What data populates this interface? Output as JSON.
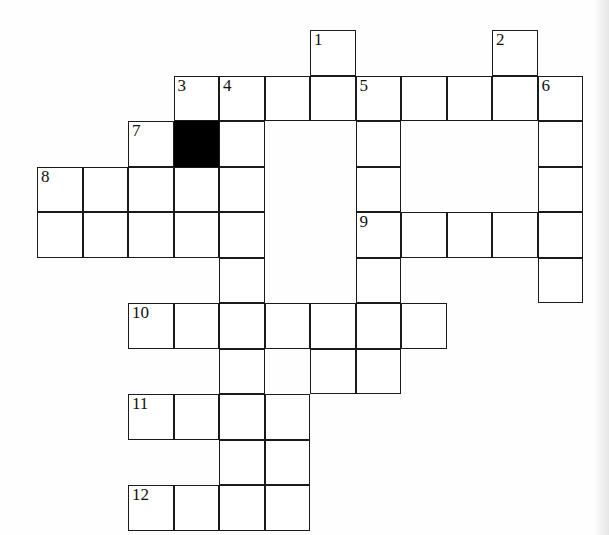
{
  "puzzle": {
    "kind": "crossword-grid",
    "title": "Crossword puzzle grid",
    "geometry": {
      "cell_size": 45.5,
      "origin_x": 37,
      "origin_y": 30,
      "cols": 12,
      "rows": 11,
      "line_color": "#1a1a1a",
      "cell_fill": "#ffffff",
      "block_fill": "#000000",
      "page_background": "#fefefe"
    },
    "numbers_visible": [
      "1",
      "2",
      "3",
      "4",
      "5",
      "6",
      "7",
      "8",
      "9",
      "10",
      "11",
      "12"
    ],
    "cells": [
      {
        "r": 0,
        "c": 6,
        "n": "1"
      },
      {
        "r": 0,
        "c": 10,
        "n": "2"
      },
      {
        "r": 1,
        "c": 3,
        "n": "3"
      },
      {
        "r": 1,
        "c": 4,
        "n": "4"
      },
      {
        "r": 1,
        "c": 5,
        "n": ""
      },
      {
        "r": 1,
        "c": 6,
        "n": ""
      },
      {
        "r": 1,
        "c": 7,
        "n": "5"
      },
      {
        "r": 1,
        "c": 8,
        "n": ""
      },
      {
        "r": 1,
        "c": 9,
        "n": ""
      },
      {
        "r": 1,
        "c": 10,
        "n": ""
      },
      {
        "r": 1,
        "c": 11,
        "n": "6"
      },
      {
        "r": 2,
        "c": 2,
        "n": "7"
      },
      {
        "r": 2,
        "c": 3,
        "n": "",
        "block": true
      },
      {
        "r": 2,
        "c": 4,
        "n": ""
      },
      {
        "r": 2,
        "c": 7,
        "n": ""
      },
      {
        "r": 2,
        "c": 11,
        "n": ""
      },
      {
        "r": 3,
        "c": 0,
        "n": "8"
      },
      {
        "r": 3,
        "c": 1,
        "n": ""
      },
      {
        "r": 3,
        "c": 2,
        "n": ""
      },
      {
        "r": 3,
        "c": 3,
        "n": ""
      },
      {
        "r": 3,
        "c": 4,
        "n": ""
      },
      {
        "r": 3,
        "c": 7,
        "n": ""
      },
      {
        "r": 3,
        "c": 11,
        "n": ""
      },
      {
        "r": 4,
        "c": 0,
        "n": ""
      },
      {
        "r": 4,
        "c": 1,
        "n": ""
      },
      {
        "r": 4,
        "c": 2,
        "n": ""
      },
      {
        "r": 4,
        "c": 3,
        "n": ""
      },
      {
        "r": 4,
        "c": 4,
        "n": ""
      },
      {
        "r": 4,
        "c": 7,
        "n": "9"
      },
      {
        "r": 4,
        "c": 8,
        "n": ""
      },
      {
        "r": 4,
        "c": 9,
        "n": ""
      },
      {
        "r": 4,
        "c": 10,
        "n": ""
      },
      {
        "r": 4,
        "c": 11,
        "n": ""
      },
      {
        "r": 5,
        "c": 4,
        "n": ""
      },
      {
        "r": 5,
        "c": 7,
        "n": ""
      },
      {
        "r": 5,
        "c": 11,
        "n": ""
      },
      {
        "r": 6,
        "c": 2,
        "n": "10"
      },
      {
        "r": 6,
        "c": 3,
        "n": ""
      },
      {
        "r": 6,
        "c": 4,
        "n": ""
      },
      {
        "r": 6,
        "c": 5,
        "n": ""
      },
      {
        "r": 6,
        "c": 6,
        "n": ""
      },
      {
        "r": 6,
        "c": 7,
        "n": ""
      },
      {
        "r": 6,
        "c": 8,
        "n": ""
      },
      {
        "r": 7,
        "c": 4,
        "n": ""
      },
      {
        "r": 7,
        "c": 6,
        "n": ""
      },
      {
        "r": 7,
        "c": 7,
        "n": ""
      },
      {
        "r": 8,
        "c": 2,
        "n": "11"
      },
      {
        "r": 8,
        "c": 3,
        "n": ""
      },
      {
        "r": 8,
        "c": 4,
        "n": ""
      },
      {
        "r": 8,
        "c": 5,
        "n": ""
      },
      {
        "r": 9,
        "c": 4,
        "n": ""
      },
      {
        "r": 9,
        "c": 5,
        "n": ""
      },
      {
        "r": 10,
        "c": 2,
        "n": "12"
      },
      {
        "r": 10,
        "c": 3,
        "n": ""
      },
      {
        "r": 10,
        "c": 4,
        "n": ""
      },
      {
        "r": 10,
        "c": 5,
        "n": ""
      }
    ]
  }
}
